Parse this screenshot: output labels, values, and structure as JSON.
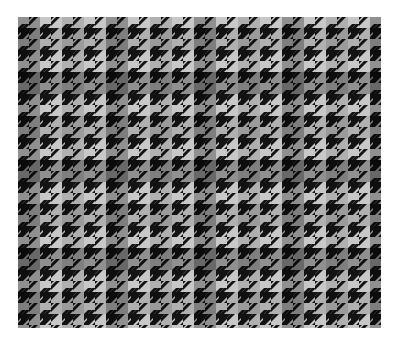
{
  "image": {
    "subject": "black and white houndstooth / glen check woven fabric swatch",
    "background": "#ffffff",
    "colors": {
      "light": "#c8c8c8",
      "mid": "#6a6a6a",
      "dark": "#141414"
    },
    "pattern": {
      "type": "houndstooth-check",
      "tile_px": 22,
      "overlay_band_px": 44
    },
    "swatch": {
      "x": 18,
      "y": 17,
      "width": 363,
      "height": 311
    }
  }
}
